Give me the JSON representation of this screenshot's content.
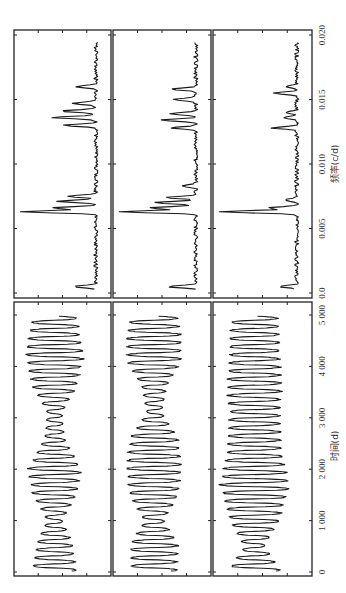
{
  "chart_data": {
    "type": "line",
    "layout": "3x2 grid rotated 90 degrees counter-clockwise (page printed sideways)",
    "panels": [
      {
        "id": "freq-1",
        "row": "spectrum",
        "column": 1,
        "xlabel": "频率(c/d)",
        "xlim": [
          0.0,
          0.021
        ],
        "peaks": [
          {
            "f": 0.0005,
            "amp": 0.3
          },
          {
            "f": 0.0063,
            "amp": 0.95
          },
          {
            "f": 0.0066,
            "amp": 0.55
          },
          {
            "f": 0.0071,
            "amp": 0.5
          },
          {
            "f": 0.0075,
            "amp": 0.38
          },
          {
            "f": 0.013,
            "amp": 0.4
          },
          {
            "f": 0.0136,
            "amp": 0.55
          },
          {
            "f": 0.0141,
            "amp": 0.45
          },
          {
            "f": 0.0147,
            "amp": 0.3
          },
          {
            "f": 0.016,
            "amp": 0.25
          }
        ]
      },
      {
        "id": "freq-2",
        "row": "spectrum",
        "column": 2,
        "xlabel": "频率(c/d)",
        "xlim": [
          0.0,
          0.021
        ],
        "peaks": [
          {
            "f": 0.0005,
            "amp": 0.35
          },
          {
            "f": 0.0063,
            "amp": 1.0
          },
          {
            "f": 0.0066,
            "amp": 0.6
          },
          {
            "f": 0.007,
            "amp": 0.55
          },
          {
            "f": 0.0074,
            "amp": 0.4
          },
          {
            "f": 0.0083,
            "amp": 0.15
          },
          {
            "f": 0.0128,
            "amp": 0.3
          },
          {
            "f": 0.0134,
            "amp": 0.45
          },
          {
            "f": 0.0139,
            "amp": 0.35
          },
          {
            "f": 0.015,
            "amp": 0.3
          },
          {
            "f": 0.0158,
            "amp": 0.3
          }
        ]
      },
      {
        "id": "freq-3",
        "row": "spectrum",
        "column": 3,
        "xlabel": "频率(c/d)",
        "xlim": [
          0.0,
          0.021
        ],
        "peaks": [
          {
            "f": 0.0005,
            "amp": 0.2
          },
          {
            "f": 0.0063,
            "amp": 1.0
          },
          {
            "f": 0.0066,
            "amp": 0.35
          },
          {
            "f": 0.0072,
            "amp": 0.15
          },
          {
            "f": 0.0128,
            "amp": 0.3
          },
          {
            "f": 0.0136,
            "amp": 0.18
          },
          {
            "f": 0.014,
            "amp": 0.12
          },
          {
            "f": 0.0155,
            "amp": 0.3
          },
          {
            "f": 0.016,
            "amp": 0.12
          }
        ]
      },
      {
        "id": "time-1",
        "row": "timeseries",
        "column": 1,
        "xlabel": "时间(d)",
        "xlim": [
          0,
          5000
        ],
        "period_days": 158,
        "envelope": [
          {
            "t": 0,
            "amp": 0.45
          },
          {
            "t": 600,
            "amp": 0.35
          },
          {
            "t": 1000,
            "amp": 0.15
          },
          {
            "t": 1500,
            "amp": 0.45
          },
          {
            "t": 2000,
            "amp": 0.55
          },
          {
            "t": 2600,
            "amp": 0.2
          },
          {
            "t": 3100,
            "amp": 0.15
          },
          {
            "t": 3600,
            "amp": 0.45
          },
          {
            "t": 4200,
            "amp": 0.6
          },
          {
            "t": 4700,
            "amp": 0.5
          },
          {
            "t": 5000,
            "amp": 0.45
          }
        ]
      },
      {
        "id": "time-2",
        "row": "timeseries",
        "column": 2,
        "xlabel": "时间(d)",
        "xlim": [
          0,
          5000
        ],
        "period_days": 158,
        "envelope": [
          {
            "t": 0,
            "amp": 0.45
          },
          {
            "t": 500,
            "amp": 0.5
          },
          {
            "t": 1000,
            "amp": 0.2
          },
          {
            "t": 1500,
            "amp": 0.5
          },
          {
            "t": 2000,
            "amp": 0.55
          },
          {
            "t": 2600,
            "amp": 0.5
          },
          {
            "t": 3100,
            "amp": 0.15
          },
          {
            "t": 3600,
            "amp": 0.25
          },
          {
            "t": 4100,
            "amp": 0.55
          },
          {
            "t": 4600,
            "amp": 0.55
          },
          {
            "t": 5000,
            "amp": 0.45
          }
        ]
      },
      {
        "id": "time-3",
        "row": "timeseries",
        "column": 3,
        "xlabel": "时间(d)",
        "xlim": [
          0,
          5000
        ],
        "period_days": 158,
        "envelope": [
          {
            "t": 0,
            "amp": 0.55
          },
          {
            "t": 500,
            "amp": 0.2
          },
          {
            "t": 1000,
            "amp": 0.5
          },
          {
            "t": 1700,
            "amp": 0.7
          },
          {
            "t": 2300,
            "amp": 0.55
          },
          {
            "t": 3000,
            "amp": 0.5
          },
          {
            "t": 3600,
            "amp": 0.55
          },
          {
            "t": 4200,
            "amp": 0.5
          },
          {
            "t": 4700,
            "amp": 0.5
          },
          {
            "t": 5000,
            "amp": 0.45
          }
        ]
      }
    ],
    "axes": {
      "spectrum": {
        "label": "频率(c/d)",
        "ticks": [
          0.0,
          0.005,
          0.01,
          0.015,
          0.02
        ],
        "tick_labels": [
          "0.0",
          "0.005",
          "0.010",
          "0.015",
          "0.020"
        ]
      },
      "timeseries": {
        "label": "时间(d)",
        "ticks": [
          0,
          1000,
          2000,
          3000,
          4000,
          5000
        ],
        "tick_labels": [
          "0",
          "1 000",
          "2 000",
          "3 000",
          "4 000",
          "5 000"
        ]
      }
    },
    "legend": null,
    "grid": false
  },
  "figure": {
    "line_color": "#1a1a1a",
    "frame_color": "#222222",
    "background": "#ffffff"
  }
}
